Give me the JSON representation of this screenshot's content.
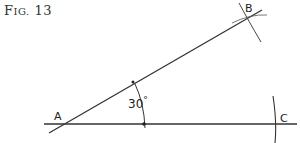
{
  "figure": {
    "title_first": "F",
    "title_rest": "IG.",
    "title_number": "13"
  },
  "points": {
    "A": "A",
    "B": "B",
    "C": "C"
  },
  "angle": {
    "value": "30",
    "unit": "°"
  },
  "colors": {
    "line": "#333333",
    "background": "#ffffff"
  }
}
